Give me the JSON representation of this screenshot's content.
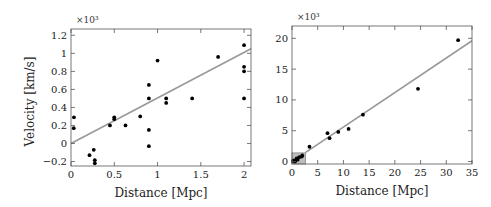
{
  "chart_data": [
    {
      "type": "scatter",
      "title": "",
      "xlabel": "Distance [Mpc]",
      "ylabel": "Velocity [km/s]",
      "y_multiplier": "×10³",
      "xlim": [
        0,
        2.08
      ],
      "ylim": [
        -0.25,
        1.27
      ],
      "xticks": [
        0,
        0.5,
        1,
        1.5,
        2
      ],
      "xtick_labels": [
        "0",
        "0.5",
        "1",
        "1.5",
        "2"
      ],
      "yticks": [
        -0.2,
        0,
        0.2,
        0.4,
        0.6,
        0.8,
        1,
        1.2
      ],
      "ytick_labels": [
        "−0.2",
        "0",
        "0.2",
        "0.4",
        "0.6",
        "0.8",
        "1",
        "1.2"
      ],
      "grid": false,
      "series": [
        {
          "name": "galaxies",
          "marker": "dot",
          "color": "#000000",
          "x": [
            0.032,
            0.034,
            0.214,
            0.263,
            0.275,
            0.275,
            0.45,
            0.5,
            0.5,
            0.63,
            0.8,
            0.9,
            0.9,
            0.9,
            0.9,
            1.0,
            1.1,
            1.1,
            1.4,
            1.7,
            2.0,
            2.0,
            2.0,
            2.0
          ],
          "y": [
            0.17,
            0.29,
            -0.13,
            -0.07,
            -0.185,
            -0.22,
            0.2,
            0.29,
            0.27,
            0.2,
            0.3,
            -0.03,
            0.65,
            0.15,
            0.5,
            0.92,
            0.45,
            0.5,
            0.5,
            0.96,
            0.5,
            0.85,
            0.8,
            1.09
          ]
        },
        {
          "name": "fit",
          "type": "line",
          "color": "#999999",
          "x": [
            0,
            2.08
          ],
          "y": [
            0.0,
            1.05
          ]
        }
      ]
    },
    {
      "type": "scatter",
      "title": "",
      "xlabel": "Distance [Mpc]",
      "ylabel": "",
      "y_multiplier": "×10³",
      "xlim": [
        0,
        35
      ],
      "ylim": [
        -0.4,
        22
      ],
      "xticks": [
        0,
        5,
        10,
        15,
        20,
        25,
        30,
        35
      ],
      "xtick_labels": [
        "0",
        "5",
        "10",
        "15",
        "20",
        "25",
        "30",
        "35"
      ],
      "yticks": [
        0,
        5,
        10,
        15,
        20
      ],
      "ytick_labels": [
        "0",
        "5",
        "10",
        "15",
        "20"
      ],
      "grid": false,
      "inset_box": {
        "x": [
          0,
          2.6
        ],
        "y": [
          -0.4,
          1.4
        ],
        "color": "#bdbdbd"
      },
      "series": [
        {
          "name": "galaxies",
          "marker": "dot",
          "color": "#000000",
          "x": [
            0.2,
            0.4,
            0.6,
            0.9,
            1.1,
            1.4,
            1.9,
            2.0,
            3.4,
            6.9,
            7.3,
            9.0,
            11.0,
            13.8,
            24.5,
            32.3
          ],
          "y": [
            0.1,
            0.2,
            0.0,
            0.5,
            0.3,
            0.7,
            0.8,
            1.0,
            2.4,
            4.6,
            3.8,
            4.8,
            5.3,
            7.6,
            11.8,
            19.7
          ],
          "note": "approximately 16 visible points; additional points overlap in the inset region near origin"
        },
        {
          "name": "fit",
          "type": "line",
          "color": "#999999",
          "x": [
            2.6,
            35
          ],
          "y": [
            1.45,
            19.6
          ]
        }
      ]
    }
  ]
}
